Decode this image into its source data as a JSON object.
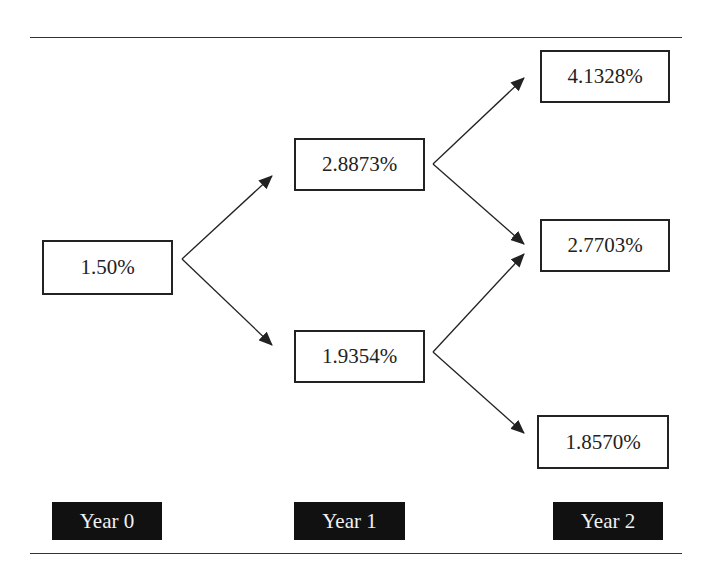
{
  "diagram": {
    "type": "binomial interest rate tree",
    "nodes": {
      "year0": "1.50%",
      "year1_up": "2.8873%",
      "year1_down": "1.9354%",
      "year2_up": "4.1328%",
      "year2_mid": "2.7703%",
      "year2_down": "1.8570%"
    },
    "labels": {
      "year0": "Year 0",
      "year1": "Year 1",
      "year2": "Year 2"
    },
    "edges": [
      {
        "from": "year0",
        "to": "year1_up"
      },
      {
        "from": "year0",
        "to": "year1_down"
      },
      {
        "from": "year1_up",
        "to": "year2_up"
      },
      {
        "from": "year1_up",
        "to": "year2_mid"
      },
      {
        "from": "year1_down",
        "to": "year2_mid"
      },
      {
        "from": "year1_down",
        "to": "year2_down"
      }
    ],
    "colors": {
      "line": "#222222",
      "label_bg": "#111111",
      "label_text": "#f2f2f2"
    }
  }
}
